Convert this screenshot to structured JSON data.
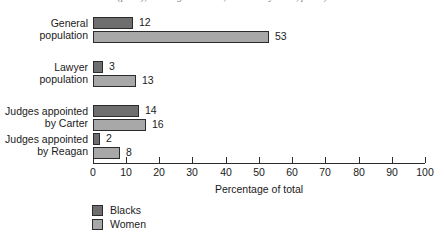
{
  "caption": "(p. 14), Los Angeles Times, 5 February 1986, pt. 12)",
  "chart_data": {
    "type": "bar",
    "orientation": "horizontal",
    "title": "",
    "xlabel": "Percentage of total",
    "ylabel": "",
    "xlim": [
      0,
      100
    ],
    "xticks": [
      0,
      10,
      20,
      30,
      40,
      50,
      60,
      70,
      80,
      90,
      100
    ],
    "grid": false,
    "legend_position": "bottom-left",
    "categories": [
      "General population",
      "Lawyer population",
      "Judges appointed by Carter",
      "Judges appointed by Reagan"
    ],
    "category_lines": [
      [
        "General",
        "population"
      ],
      [
        "Lawyer",
        "population"
      ],
      [
        "Judges appointed",
        "by Carter"
      ],
      [
        "Judges appointed",
        "by Reagan"
      ]
    ],
    "series": [
      {
        "name": "Blacks",
        "color": "#6e6e6e",
        "values": [
          12,
          3,
          14,
          2
        ]
      },
      {
        "name": "Women",
        "color": "#a8a8a8",
        "values": [
          53,
          13,
          16,
          8
        ]
      }
    ]
  },
  "legend": {
    "items": [
      {
        "label": "Blacks"
      },
      {
        "label": "Women"
      }
    ]
  }
}
